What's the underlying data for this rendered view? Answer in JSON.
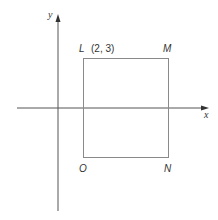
{
  "diagram": {
    "axes": {
      "x_label": "x",
      "y_label": "y"
    },
    "vertices": {
      "L": {
        "label": "L",
        "coord_text": "(2, 3)"
      },
      "M": {
        "label": "M"
      },
      "N": {
        "label": "N"
      },
      "O": {
        "label": "O"
      }
    },
    "colors": {
      "line": "#8a8a8a",
      "axis": "#555555",
      "text": "#333333"
    }
  }
}
